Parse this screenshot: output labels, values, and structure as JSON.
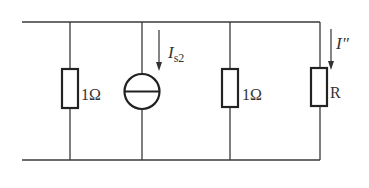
{
  "diagram": {
    "type": "circuit-schematic",
    "colors": {
      "wire": "#3a3a3a",
      "component": "#222222",
      "text": "#333333",
      "background": "#ffffff"
    },
    "branches": [
      {
        "id": "r1",
        "kind": "resistor",
        "label": "1Ω"
      },
      {
        "id": "is2",
        "kind": "current-source",
        "label_main": "I",
        "label_sub": "s2",
        "direction": "down"
      },
      {
        "id": "r2",
        "kind": "resistor",
        "label": "1Ω"
      },
      {
        "id": "r",
        "kind": "resistor",
        "label": "R",
        "current_label": "I″",
        "current_direction": "down"
      }
    ]
  }
}
